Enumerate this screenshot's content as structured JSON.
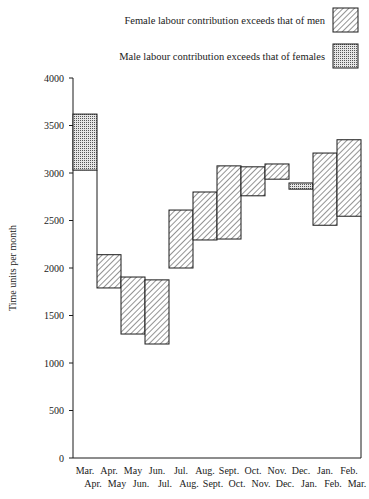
{
  "chart_data": {
    "type": "bar",
    "subtype": "floating-range",
    "title": "",
    "xlabel": "",
    "ylabel": "Time units per month",
    "ylim": [
      0,
      4000
    ],
    "yticks": [
      0,
      500,
      1000,
      1500,
      2000,
      2500,
      3000,
      3500,
      4000
    ],
    "grid": false,
    "legend_position": "top-right",
    "legend": [
      {
        "label": "Female labour contribution exceeds that of men",
        "pattern": "hatch"
      },
      {
        "label": "Male labour contribution exceeds that of females",
        "pattern": "dots"
      }
    ],
    "categories_top": [
      "Mar.",
      "Apr.",
      "May",
      "Jun.",
      "Jul.",
      "Aug.",
      "Sept.",
      "Oct.",
      "Nov.",
      "Dec.",
      "Jan.",
      "Feb."
    ],
    "categories_bottom": [
      "Apr.",
      "May",
      "Jun.",
      "Jul.",
      "Aug.",
      "Sept.",
      "Oct.",
      "Nov.",
      "Dec.",
      "Jan.",
      "Feb.",
      "Mar."
    ],
    "series": [
      {
        "name": "Upper value (time units per month)",
        "values": [
          3620,
          2140,
          1905,
          1875,
          2610,
          2800,
          3075,
          3065,
          3095,
          2895,
          3210,
          3350
        ]
      },
      {
        "name": "Lower value (time units per month)",
        "values": [
          3030,
          1790,
          1305,
          1200,
          2000,
          2295,
          2305,
          2760,
          2935,
          2830,
          2450,
          2545
        ]
      }
    ],
    "pattern_by_period": [
      "dots",
      "hatch",
      "hatch",
      "hatch",
      "hatch",
      "hatch",
      "hatch",
      "hatch",
      "hatch",
      "dots",
      "hatch",
      "hatch"
    ]
  }
}
